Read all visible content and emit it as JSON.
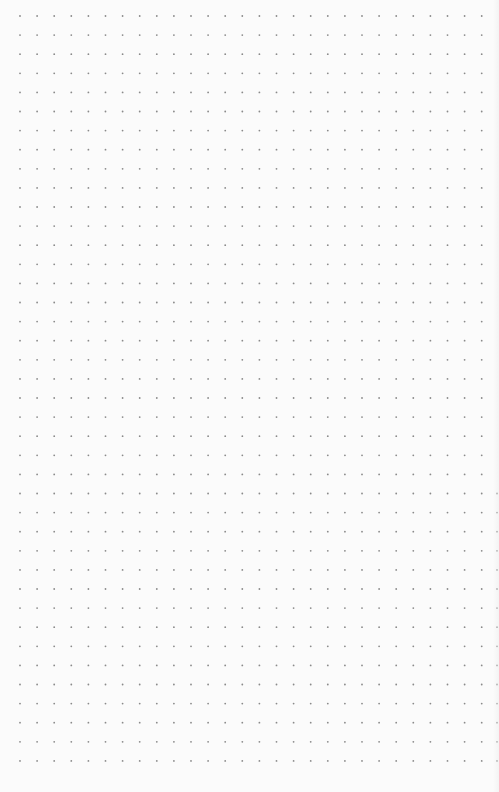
{
  "page": {
    "type": "dot-grid-paper",
    "background_color": "#fbfbfb",
    "dot_color": "#8a8a8a",
    "edge_dot_color": "#b5b5b5"
  },
  "grid": {
    "origin_x": 20,
    "origin_y": 16,
    "spacing_x": 17.1,
    "spacing_y": 19.1,
    "columns": 28,
    "rows": 40,
    "dot_radius": 0.9,
    "edge_column": {
      "x": 497,
      "start_row": 25
    }
  }
}
